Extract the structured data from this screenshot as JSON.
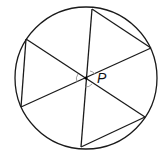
{
  "diagram": {
    "center_label": "P",
    "circle": {
      "cx": 86,
      "cy": 78,
      "r": 71
    },
    "center": {
      "x": 86,
      "y": 78
    },
    "vertices": [
      {
        "x": 92,
        "y": 9
      },
      {
        "x": 151,
        "y": 48
      },
      {
        "x": 145,
        "y": 117
      },
      {
        "x": 81,
        "y": 147
      },
      {
        "x": 21,
        "y": 107
      },
      {
        "x": 26,
        "y": 39
      }
    ],
    "chords": [
      [
        0,
        5
      ],
      [
        1,
        0
      ],
      [
        2,
        1
      ],
      [
        3,
        2
      ],
      [
        4,
        3
      ],
      [
        5,
        4
      ]
    ],
    "stroke_color": "#1a1a1a",
    "angle_marks_color": "#888888"
  }
}
